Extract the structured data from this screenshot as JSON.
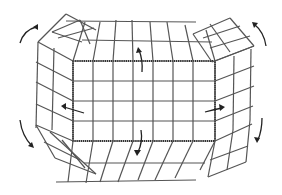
{
  "figure": {
    "colors": {
      "background": "#ffffff",
      "wire": "#555555",
      "edge": "#333333",
      "arrow": "#222222"
    },
    "base_panel": {
      "x": 73,
      "y": 61,
      "width": 142,
      "height": 80,
      "cols": 7,
      "rows": 4
    },
    "arrows": [
      {
        "id": "top-left-outer",
        "direction": "up-right"
      },
      {
        "id": "top-right-outer",
        "direction": "down-right"
      },
      {
        "id": "bottom-left-outer",
        "direction": "down-right"
      },
      {
        "id": "bottom-right-outer",
        "direction": "down-left"
      },
      {
        "id": "center-top",
        "direction": "up"
      },
      {
        "id": "center-left",
        "direction": "left"
      },
      {
        "id": "center-right",
        "direction": "right"
      },
      {
        "id": "center-bottom",
        "direction": "down"
      }
    ]
  }
}
